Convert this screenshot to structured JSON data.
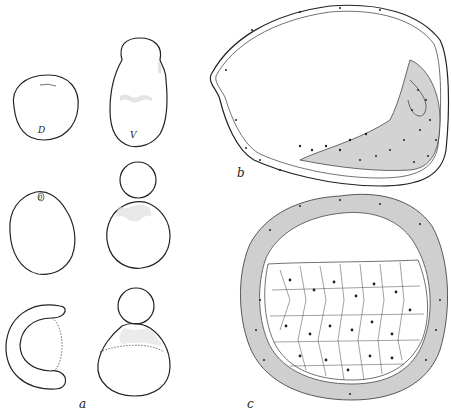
{
  "figure": {
    "panels": [
      {
        "id": "a",
        "label": "a",
        "description": "Six outline drawings of embryos in surface view, two columns of three",
        "sub_labels": [
          "D",
          "V",
          "0"
        ]
      },
      {
        "id": "b",
        "label": "b",
        "description": "Sagittal section of elongated embryo with thin wall and cellular mass at right"
      },
      {
        "id": "c",
        "label": "c",
        "description": "Cross section of rounded embryo with thick cellular wall and large-celled yolk mass below"
      }
    ],
    "colors": {
      "ink": "#222222",
      "background": "#ffffff",
      "stipple": "#cfcfcf"
    }
  }
}
